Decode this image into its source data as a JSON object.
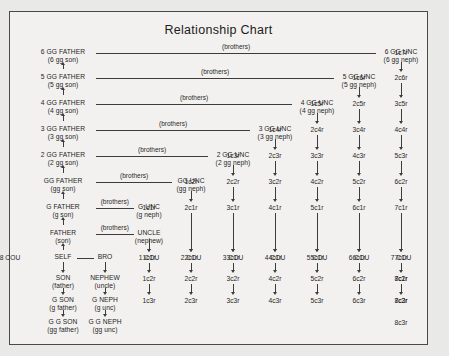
{
  "title": "Relationship Chart",
  "brothers_label": "(brothers)",
  "geometry": {
    "col_x": [
      62,
      104,
      148,
      190,
      232,
      274,
      316,
      358,
      400
    ],
    "row_y": [
      52,
      77,
      103,
      129,
      155,
      181,
      207,
      233,
      257,
      278,
      300,
      322
    ]
  },
  "ancestors": [
    {
      "main": "6 GG FATHER",
      "sub": "(6 gg son)",
      "row": 0
    },
    {
      "main": "5 GG FATHER",
      "sub": "(5 gg son)",
      "row": 1
    },
    {
      "main": "4 GG FATHER",
      "sub": "(4 gg son)",
      "row": 2
    },
    {
      "main": "3 GG FATHER",
      "sub": "(3 gg son)",
      "row": 3
    },
    {
      "main": "2 GG FATHER",
      "sub": "(2 gg son)",
      "row": 4
    },
    {
      "main": "GG FATHER",
      "sub": "(gg son)",
      "row": 5
    },
    {
      "main": "G FATHER",
      "sub": "(g son)",
      "row": 6
    },
    {
      "main": "FATHER",
      "sub": "(son)",
      "row": 7
    }
  ],
  "self_node": {
    "main": "SELF",
    "sub": ""
  },
  "descendants": [
    {
      "main": "SON",
      "sub": "(father)"
    },
    {
      "main": "G SON",
      "sub": "(g father)"
    },
    {
      "main": "G G SON",
      "sub": "(gg father)"
    }
  ],
  "uncles": [
    {
      "main": "6 GG UNC",
      "sub": "(6 gg neph)",
      "row": 0,
      "col": 8
    },
    {
      "main": "5 GG UNC",
      "sub": "(5 gg neph)",
      "row": 1,
      "col": 7
    },
    {
      "main": "4 GG UNC",
      "sub": "(4 gg neph)",
      "row": 2,
      "col": 6
    },
    {
      "main": "3 GG UNC",
      "sub": "(3 gg neph)",
      "row": 3,
      "col": 5
    },
    {
      "main": "2 GG UNC",
      "sub": "(2 gg neph)",
      "row": 4,
      "col": 4
    },
    {
      "main": "GG UNC",
      "sub": "(gg neph)",
      "row": 5,
      "col": 3
    },
    {
      "main": "G UNC",
      "sub": "(g neph)",
      "row": 6,
      "col": 2
    },
    {
      "main": "UNCLE",
      "sub": "(nephew)",
      "row": 7,
      "col": 2
    }
  ],
  "bro_node": {
    "main": "BRO",
    "sub": ""
  },
  "nephews": [
    {
      "main": "NEPHEW",
      "sub": "(uncle)"
    },
    {
      "main": "G NEPH",
      "sub": "(g unc)"
    },
    {
      "main": "G G NEPH",
      "sub": "(gg unc)"
    }
  ],
  "cousin_headers": [
    "1 COU",
    "2 COU",
    "3 COU",
    "4 COU",
    "5 COU",
    "6 COU",
    "7 COU",
    "8 COU"
  ],
  "removed_grid": [
    {
      "row": 0,
      "col": 8,
      "label": "1c7r"
    },
    {
      "row": 1,
      "col": 7,
      "label": "1c6r"
    },
    {
      "row": 1,
      "col": 8,
      "label": "2c6r"
    },
    {
      "row": 2,
      "col": 6,
      "label": "1c5r"
    },
    {
      "row": 2,
      "col": 7,
      "label": "2c5r"
    },
    {
      "row": 2,
      "col": 8,
      "label": "3c5r"
    },
    {
      "row": 3,
      "col": 5,
      "label": "1c4r"
    },
    {
      "row": 3,
      "col": 6,
      "label": "2c4r"
    },
    {
      "row": 3,
      "col": 7,
      "label": "3c4r"
    },
    {
      "row": 3,
      "col": 8,
      "label": "4c4r"
    },
    {
      "row": 4,
      "col": 4,
      "label": "1c3r"
    },
    {
      "row": 4,
      "col": 5,
      "label": "2c3r"
    },
    {
      "row": 4,
      "col": 6,
      "label": "3c3r"
    },
    {
      "row": 4,
      "col": 7,
      "label": "4c3r"
    },
    {
      "row": 4,
      "col": 8,
      "label": "5c3r"
    },
    {
      "row": 5,
      "col": 3,
      "label": "1c2r"
    },
    {
      "row": 5,
      "col": 4,
      "label": "2c2r"
    },
    {
      "row": 5,
      "col": 5,
      "label": "3c2r"
    },
    {
      "row": 5,
      "col": 6,
      "label": "4c2r"
    },
    {
      "row": 5,
      "col": 7,
      "label": "5c2r"
    },
    {
      "row": 5,
      "col": 8,
      "label": "6c2r"
    },
    {
      "row": 6,
      "col": 2,
      "label": "1c1r"
    },
    {
      "row": 6,
      "col": 3,
      "label": "2c1r"
    },
    {
      "row": 6,
      "col": 4,
      "label": "3c1r"
    },
    {
      "row": 6,
      "col": 5,
      "label": "4c1r"
    },
    {
      "row": 6,
      "col": 6,
      "label": "5c1r"
    },
    {
      "row": 6,
      "col": 7,
      "label": "6c1r"
    },
    {
      "row": 6,
      "col": 8,
      "label": "7c1r"
    },
    {
      "row": 8,
      "col": 2,
      "label": "1c1r"
    },
    {
      "row": 8,
      "col": 3,
      "label": "2c1r"
    },
    {
      "row": 8,
      "col": 4,
      "label": "3c1r"
    },
    {
      "row": 8,
      "col": 5,
      "label": "4c1r"
    },
    {
      "row": 8,
      "col": 6,
      "label": "5c1r"
    },
    {
      "row": 8,
      "col": 7,
      "label": "6c1r"
    },
    {
      "row": 8,
      "col": 8,
      "label": "7c1r"
    },
    {
      "row": 9,
      "col": 2,
      "label": "1c2r"
    },
    {
      "row": 9,
      "col": 3,
      "label": "2c2r"
    },
    {
      "row": 9,
      "col": 4,
      "label": "3c2r"
    },
    {
      "row": 9,
      "col": 5,
      "label": "4c2r"
    },
    {
      "row": 9,
      "col": 6,
      "label": "5c2r"
    },
    {
      "row": 9,
      "col": 7,
      "label": "6c2r"
    },
    {
      "row": 9,
      "col": 8,
      "label": "7c2r"
    },
    {
      "row": 10,
      "col": 2,
      "label": "1c3r"
    },
    {
      "row": 10,
      "col": 3,
      "label": "2c3r"
    },
    {
      "row": 10,
      "col": 4,
      "label": "3c3r"
    },
    {
      "row": 10,
      "col": 5,
      "label": "4c3r"
    },
    {
      "row": 10,
      "col": 6,
      "label": "5c3r"
    },
    {
      "row": 10,
      "col": 7,
      "label": "6c3r"
    },
    {
      "row": 10,
      "col": 8,
      "label": "7c3r"
    }
  ],
  "cousin_col9": {
    "header": "8 COU",
    "cells": [
      "8c1r",
      "8c2r",
      "8c3r"
    ]
  },
  "colors": {
    "ink": "#1f1f1f",
    "line": "#3c3c3c",
    "paper": "#f2f1ef",
    "page": "#e9e9e7"
  }
}
